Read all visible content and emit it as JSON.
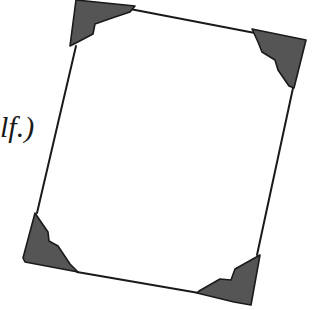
{
  "caption": {
    "text": "lf.)"
  },
  "colors": {
    "frame_line": "#1a1a1a",
    "corner_fill": "#555555",
    "corner_stroke": "#1a1a1a",
    "background": "#ffffff"
  },
  "figure": {
    "frame_edges": [
      {
        "name": "top",
        "from": [
          130,
          9
        ],
        "to": [
          255,
          33
        ]
      },
      {
        "name": "right",
        "from": [
          293,
          88
        ],
        "to": [
          257,
          255
        ]
      },
      {
        "name": "bottom",
        "from": [
          77,
          272
        ],
        "to": [
          199,
          293
        ]
      },
      {
        "name": "left",
        "from": [
          37,
          213
        ],
        "to": [
          76,
          46
        ]
      }
    ],
    "corners": [
      {
        "name": "top-left",
        "points": "76,0 135,6 130,12 112,18 95,24 93,34 74,44 70,46"
      },
      {
        "name": "top-right",
        "points": "252,29 306,40 294,88 289,86 278,70 275,60 262,52 258,42"
      },
      {
        "name": "bottom-left",
        "points": "35,213 39,219 48,232 49,241 58,246 70,264 78,272 25,262 23,258"
      },
      {
        "name": "bottom-right",
        "points": "260,255 251,305 234,302 197,293 199,291 220,279 231,280 235,269"
      }
    ]
  }
}
